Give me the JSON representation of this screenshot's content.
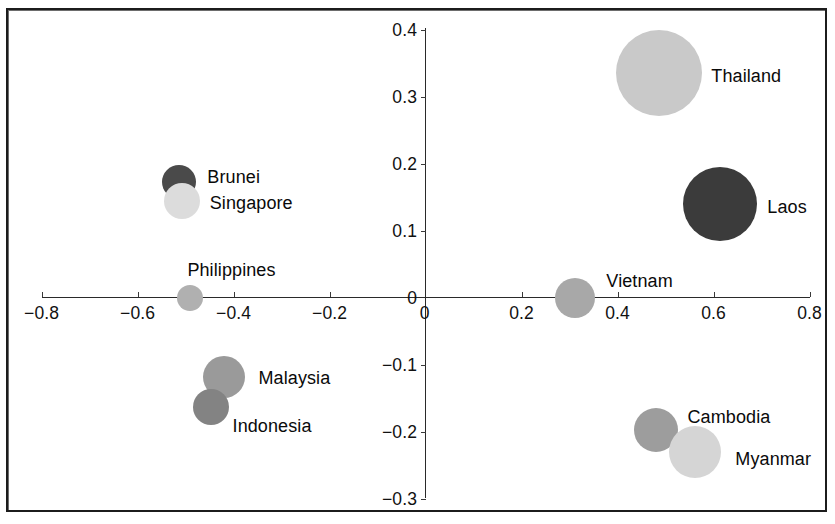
{
  "chart_data": {
    "type": "scatter",
    "title": "",
    "xlabel": "",
    "ylabel": "",
    "xlim": [
      -0.8,
      0.8
    ],
    "ylim": [
      -0.3,
      0.4
    ],
    "grid": false,
    "legend": "none",
    "note": "Bubble / scatter map of ASEAN countries on two unlabeled dimensions; bubble area encodes a third magnitude and fill greyscale varies per country.",
    "x_ticks": [
      "-0.8",
      "-0.6",
      "-0.4",
      "-0.2",
      "0",
      "0.2",
      "0.4",
      "0.6",
      "0.8"
    ],
    "x_tick_values": [
      -0.8,
      -0.6,
      -0.4,
      -0.2,
      0,
      0.2,
      0.4,
      0.6,
      0.8
    ],
    "y_ticks": [
      "0.4",
      "0.3",
      "0.2",
      "0.1",
      "0",
      "-0.1",
      "-0.2",
      "-0.3"
    ],
    "y_tick_values": [
      0.4,
      0.3,
      0.2,
      0.1,
      0,
      -0.1,
      -0.2,
      -0.3
    ],
    "origin_label": "0",
    "points": [
      {
        "label": "Thailand",
        "x": 0.487,
        "y": 0.335,
        "radius_px": 43,
        "color": "#c9c9c9",
        "label_dx": 52,
        "label_dy": 4
      },
      {
        "label": "Laos",
        "x": 0.614,
        "y": 0.139,
        "radius_px": 37,
        "color": "#3b3b3b",
        "label_dx": 47,
        "label_dy": 4
      },
      {
        "label": "Brunei",
        "x": -0.513,
        "y": 0.172,
        "radius_px": 17,
        "color": "#4a4a4a",
        "label_dx": 28,
        "label_dy": -4
      },
      {
        "label": "Singapore",
        "x": -0.508,
        "y": 0.144,
        "radius_px": 18,
        "color": "#dcdcdc",
        "label_dx": 28,
        "label_dy": 3
      },
      {
        "label": "Philippines",
        "x": -0.49,
        "y": 0.0,
        "radius_px": 13,
        "color": "#b0b0b0",
        "label_dx": -3,
        "label_dy": -27
      },
      {
        "label": "Malaysia",
        "x": -0.419,
        "y": -0.119,
        "radius_px": 21,
        "color": "#9a9a9a",
        "label_dx": 34,
        "label_dy": 2
      },
      {
        "label": "Indonesia",
        "x": -0.448,
        "y": -0.163,
        "radius_px": 18,
        "color": "#838383",
        "label_dx": 22,
        "label_dy": 20
      },
      {
        "label": "Vietnam",
        "x": 0.312,
        "y": -0.001,
        "radius_px": 20,
        "color": "#a8a8a8",
        "label_dx": 31,
        "label_dy": -16
      },
      {
        "label": "Cambodia",
        "x": 0.479,
        "y": -0.197,
        "radius_px": 22,
        "color": "#9d9d9d",
        "label_dx": 32,
        "label_dy": -12
      },
      {
        "label": "Myanmar",
        "x": 0.562,
        "y": -0.23,
        "radius_px": 26,
        "color": "#d5d5d5",
        "label_dx": 40,
        "label_dy": 8
      }
    ]
  },
  "colors": {
    "frame": "#1c1c1c",
    "axis": "#2a2a2a",
    "text": "#0a0a0a",
    "background": "#ffffff"
  }
}
